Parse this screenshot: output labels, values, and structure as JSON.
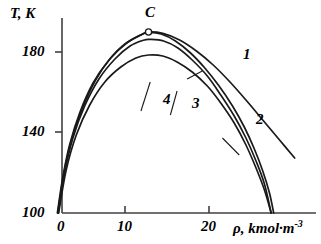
{
  "chart_data": {
    "type": "line",
    "title": "",
    "xlabel": "ρ, kmol·m",
    "xlabel_exponent": "-3",
    "ylabel": "T, K",
    "xlim": [
      -0.6,
      29.5
    ],
    "ylim": [
      100,
      199
    ],
    "xticks": [
      0,
      10,
      20
    ],
    "xticklabels": [
      "0",
      "10",
      "20"
    ],
    "yticks": [
      100,
      140,
      180
    ],
    "yticklabels": [
      "100",
      "140",
      "180"
    ],
    "grid": false,
    "legend": "inline-curve-labels",
    "annotations": [
      {
        "name": "critical-point",
        "label": "C",
        "marker": "open-circle",
        "x": 12.8,
        "y": 190.5
      }
    ],
    "series": [
      {
        "name": "1",
        "label": "1",
        "label_x": 19.4,
        "label_y": 172.0,
        "points": [
          [
            1.95,
            100.0
          ],
          [
            2.6,
            118.0
          ],
          [
            3.4,
            134.0
          ],
          [
            4.6,
            150.0
          ],
          [
            6.2,
            165.0
          ],
          [
            8.0,
            176.0
          ],
          [
            10.0,
            184.5
          ],
          [
            12.0,
            189.3
          ],
          [
            12.8,
            190.5
          ],
          [
            14.5,
            189.8
          ],
          [
            16.5,
            186.5
          ],
          [
            18.5,
            181.0
          ],
          [
            20.5,
            174.0
          ],
          [
            22.5,
            165.5
          ],
          [
            24.5,
            156.0
          ],
          [
            26.5,
            146.0
          ],
          [
            28.5,
            136.0
          ],
          [
            30.2,
            127.5
          ]
        ]
      },
      {
        "name": "2",
        "label": "2",
        "label_x": 20.9,
        "label_y": 139.5,
        "points": [
          [
            2.0,
            100.0
          ],
          [
            2.7,
            119.0
          ],
          [
            3.6,
            136.0
          ],
          [
            4.9,
            152.0
          ],
          [
            6.5,
            166.5
          ],
          [
            8.3,
            177.5
          ],
          [
            10.2,
            185.0
          ],
          [
            12.0,
            189.3
          ],
          [
            12.8,
            190.3
          ],
          [
            14.3,
            189.5
          ],
          [
            16.0,
            186.0
          ],
          [
            17.8,
            180.0
          ],
          [
            19.5,
            172.5
          ],
          [
            21.2,
            163.5
          ],
          [
            22.8,
            153.5
          ],
          [
            24.2,
            143.0
          ],
          [
            25.4,
            132.0
          ],
          [
            26.4,
            121.0
          ],
          [
            27.2,
            110.0
          ],
          [
            27.7,
            100.0
          ]
        ]
      },
      {
        "name": "3",
        "label": "3",
        "label_x": 15.0,
        "label_y": 144.0,
        "points": [
          [
            2.05,
            100.0
          ],
          [
            2.8,
            120.0
          ],
          [
            3.8,
            137.5
          ],
          [
            5.2,
            153.5
          ],
          [
            6.9,
            167.0
          ],
          [
            8.8,
            177.0
          ],
          [
            10.6,
            183.5
          ],
          [
            12.2,
            186.4
          ],
          [
            13.0,
            186.8
          ],
          [
            14.6,
            186.0
          ],
          [
            16.3,
            182.5
          ],
          [
            18.0,
            176.5
          ],
          [
            19.8,
            168.5
          ],
          [
            21.4,
            159.0
          ],
          [
            23.0,
            148.5
          ],
          [
            24.4,
            137.5
          ],
          [
            25.6,
            126.0
          ],
          [
            26.6,
            114.5
          ],
          [
            27.4,
            100.0
          ]
        ]
      },
      {
        "name": "4",
        "label": "4",
        "label_x": 11.5,
        "label_y": 146.0,
        "points": [
          [
            2.1,
            100.0
          ],
          [
            3.0,
            121.5
          ],
          [
            4.2,
            139.0
          ],
          [
            5.8,
            154.0
          ],
          [
            7.6,
            165.5
          ],
          [
            9.5,
            173.0
          ],
          [
            11.3,
            177.5
          ],
          [
            12.8,
            179.0
          ],
          [
            14.5,
            178.5
          ],
          [
            16.2,
            175.5
          ],
          [
            18.0,
            170.5
          ],
          [
            19.8,
            163.5
          ],
          [
            21.4,
            155.0
          ],
          [
            23.0,
            145.0
          ],
          [
            24.4,
            134.0
          ],
          [
            25.6,
            122.5
          ],
          [
            26.6,
            111.5
          ],
          [
            27.4,
            100.0
          ]
        ]
      }
    ],
    "leaders": [
      {
        "name": "leader-1",
        "x1": 17.4,
        "y1": 167.0,
        "x2": 19.2,
        "y2": 171.0
      },
      {
        "name": "leader-2",
        "x1": 23.6,
        "y1": 129.0,
        "x2": 21.6,
        "y2": 137.5
      },
      {
        "name": "leader-3",
        "x1": 16.2,
        "y1": 161.0,
        "x2": 15.4,
        "y2": 149.0
      },
      {
        "name": "leader-4",
        "x1": 13.0,
        "y1": 165.5,
        "x2": 11.9,
        "y2": 151.0
      }
    ]
  },
  "axes": {
    "y_title": "T, K",
    "x_title": "ρ, kmol·m",
    "x_title_exponent": "-3",
    "tick_y_180": "180",
    "tick_y_140": "140",
    "tick_y_100": "100",
    "tick_x_0": "0",
    "tick_x_10": "10",
    "tick_x_20": "20"
  },
  "labels": {
    "curve1": "1",
    "curve2": "2",
    "curve3": "3",
    "curve4": "4",
    "critical_point": "C"
  },
  "style": {
    "line_color": "#1a1a1a",
    "axis_color": "#404040",
    "marker_fill": "#ffffff",
    "background": "#ffffff"
  }
}
